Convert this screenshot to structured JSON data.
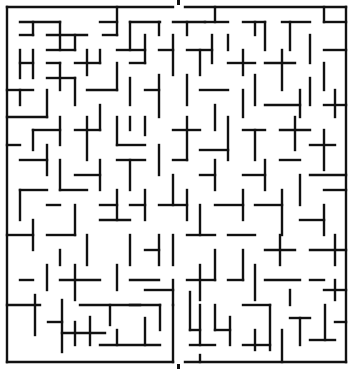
{
  "maze": {
    "title": "",
    "wall_color": "#111111",
    "background_color": "#ffffff",
    "bounds": {
      "left": 7,
      "top": 7,
      "right": 346,
      "bottom": 362
    },
    "entrance": {
      "side": "top",
      "x_from": 173,
      "x_to": 185
    },
    "exit": {
      "side": "bottom",
      "x_from": 173,
      "x_to": 185
    },
    "walls": [
      [
        7,
        7,
        173,
        7
      ],
      [
        185,
        7,
        346,
        7
      ],
      [
        7,
        7,
        7,
        362
      ],
      [
        346,
        7,
        346,
        362
      ],
      [
        7,
        362,
        173,
        362
      ],
      [
        185,
        362,
        346,
        362
      ],
      [
        20,
        22,
        60,
        22
      ],
      [
        33,
        22,
        33,
        35
      ],
      [
        20,
        35,
        33,
        35
      ],
      [
        47,
        35,
        87,
        35
      ],
      [
        60,
        22,
        60,
        50
      ],
      [
        47,
        50,
        75,
        50
      ],
      [
        75,
        35,
        75,
        50
      ],
      [
        100,
        22,
        117,
        22
      ],
      [
        117,
        7,
        117,
        35
      ],
      [
        103,
        35,
        117,
        35
      ],
      [
        130,
        22,
        160,
        22
      ],
      [
        130,
        22,
        130,
        50
      ],
      [
        145,
        35,
        145,
        63
      ],
      [
        159,
        22,
        159,
        35
      ],
      [
        173,
        22,
        205,
        22
      ],
      [
        187,
        22,
        187,
        35
      ],
      [
        215,
        7,
        215,
        22
      ],
      [
        205,
        22,
        228,
        22
      ],
      [
        228,
        35,
        228,
        50
      ],
      [
        243,
        22,
        265,
        22
      ],
      [
        255,
        22,
        255,
        35
      ],
      [
        265,
        22,
        265,
        50
      ],
      [
        282,
        22,
        310,
        22
      ],
      [
        290,
        22,
        290,
        50
      ],
      [
        324,
        22,
        346,
        22
      ],
      [
        324,
        7,
        324,
        22
      ],
      [
        20,
        50,
        20,
        78
      ],
      [
        20,
        63,
        33,
        63
      ],
      [
        33,
        50,
        33,
        78
      ],
      [
        47,
        63,
        60,
        63
      ],
      [
        60,
        63,
        60,
        90
      ],
      [
        75,
        63,
        100,
        63
      ],
      [
        87,
        50,
        87,
        75
      ],
      [
        100,
        50,
        100,
        63
      ],
      [
        117,
        50,
        145,
        50
      ],
      [
        117,
        63,
        117,
        90
      ],
      [
        130,
        63,
        145,
        63
      ],
      [
        159,
        50,
        173,
        50
      ],
      [
        173,
        35,
        173,
        75
      ],
      [
        187,
        50,
        212,
        50
      ],
      [
        200,
        50,
        200,
        75
      ],
      [
        212,
        35,
        212,
        63
      ],
      [
        228,
        63,
        255,
        63
      ],
      [
        243,
        50,
        243,
        75
      ],
      [
        265,
        63,
        295,
        63
      ],
      [
        282,
        50,
        282,
        90
      ],
      [
        310,
        35,
        310,
        63
      ],
      [
        324,
        50,
        346,
        50
      ],
      [
        324,
        63,
        324,
        90
      ],
      [
        7,
        90,
        33,
        90
      ],
      [
        20,
        90,
        20,
        105
      ],
      [
        47,
        78,
        75,
        78
      ],
      [
        47,
        90,
        47,
        117
      ],
      [
        75,
        78,
        75,
        105
      ],
      [
        87,
        90,
        117,
        90
      ],
      [
        100,
        105,
        100,
        130
      ],
      [
        130,
        78,
        130,
        105
      ],
      [
        145,
        90,
        159,
        90
      ],
      [
        159,
        75,
        159,
        117
      ],
      [
        187,
        75,
        187,
        105
      ],
      [
        200,
        90,
        228,
        90
      ],
      [
        215,
        105,
        215,
        130
      ],
      [
        243,
        90,
        243,
        117
      ],
      [
        255,
        75,
        255,
        105
      ],
      [
        265,
        105,
        300,
        105
      ],
      [
        300,
        90,
        300,
        117
      ],
      [
        310,
        78,
        310,
        105
      ],
      [
        324,
        105,
        346,
        105
      ],
      [
        335,
        90,
        335,
        117
      ],
      [
        7,
        117,
        47,
        117
      ],
      [
        33,
        130,
        33,
        150
      ],
      [
        33,
        130,
        60,
        130
      ],
      [
        60,
        117,
        60,
        145
      ],
      [
        75,
        130,
        100,
        130
      ],
      [
        87,
        117,
        87,
        160
      ],
      [
        117,
        117,
        117,
        145
      ],
      [
        117,
        145,
        145,
        145
      ],
      [
        130,
        117,
        130,
        130
      ],
      [
        145,
        117,
        145,
        135
      ],
      [
        173,
        130,
        200,
        130
      ],
      [
        187,
        117,
        187,
        160
      ],
      [
        200,
        150,
        228,
        150
      ],
      [
        228,
        117,
        228,
        160
      ],
      [
        243,
        130,
        265,
        130
      ],
      [
        255,
        130,
        255,
        160
      ],
      [
        280,
        130,
        310,
        130
      ],
      [
        295,
        117,
        295,
        150
      ],
      [
        310,
        145,
        335,
        145
      ],
      [
        324,
        130,
        324,
        170
      ],
      [
        7,
        145,
        20,
        145
      ],
      [
        20,
        160,
        47,
        160
      ],
      [
        47,
        145,
        47,
        175
      ],
      [
        60,
        160,
        60,
        190
      ],
      [
        75,
        175,
        100,
        175
      ],
      [
        100,
        160,
        100,
        190
      ],
      [
        117,
        160,
        145,
        160
      ],
      [
        130,
        160,
        130,
        190
      ],
      [
        159,
        145,
        159,
        175
      ],
      [
        173,
        160,
        187,
        160
      ],
      [
        173,
        175,
        173,
        205
      ],
      [
        200,
        175,
        215,
        175
      ],
      [
        215,
        160,
        215,
        190
      ],
      [
        243,
        175,
        265,
        175
      ],
      [
        265,
        160,
        265,
        190
      ],
      [
        280,
        160,
        300,
        160
      ],
      [
        300,
        175,
        300,
        205
      ],
      [
        310,
        175,
        346,
        175
      ],
      [
        324,
        190,
        346,
        190
      ],
      [
        20,
        190,
        20,
        220
      ],
      [
        20,
        190,
        47,
        190
      ],
      [
        47,
        205,
        60,
        205
      ],
      [
        60,
        190,
        87,
        190
      ],
      [
        75,
        205,
        75,
        235
      ],
      [
        100,
        205,
        117,
        205
      ],
      [
        117,
        190,
        117,
        220
      ],
      [
        130,
        205,
        145,
        205
      ],
      [
        145,
        190,
        145,
        220
      ],
      [
        159,
        205,
        187,
        205
      ],
      [
        187,
        190,
        187,
        220
      ],
      [
        200,
        205,
        200,
        235
      ],
      [
        215,
        205,
        243,
        205
      ],
      [
        243,
        190,
        243,
        220
      ],
      [
        255,
        205,
        282,
        205
      ],
      [
        282,
        190,
        282,
        235
      ],
      [
        300,
        220,
        324,
        220
      ],
      [
        324,
        205,
        324,
        235
      ],
      [
        7,
        235,
        33,
        235
      ],
      [
        33,
        220,
        33,
        250
      ],
      [
        47,
        235,
        75,
        235
      ],
      [
        60,
        250,
        60,
        265
      ],
      [
        87,
        235,
        87,
        265
      ],
      [
        100,
        220,
        130,
        220
      ],
      [
        130,
        235,
        130,
        265
      ],
      [
        145,
        250,
        159,
        250
      ],
      [
        159,
        235,
        159,
        265
      ],
      [
        173,
        235,
        173,
        265
      ],
      [
        187,
        235,
        215,
        235
      ],
      [
        215,
        250,
        215,
        280
      ],
      [
        228,
        235,
        255,
        235
      ],
      [
        243,
        250,
        243,
        280
      ],
      [
        265,
        250,
        295,
        250
      ],
      [
        280,
        235,
        280,
        265
      ],
      [
        310,
        250,
        346,
        250
      ],
      [
        335,
        235,
        335,
        265
      ],
      [
        20,
        280,
        33,
        280
      ],
      [
        47,
        265,
        47,
        290
      ],
      [
        60,
        280,
        100,
        280
      ],
      [
        75,
        265,
        75,
        300
      ],
      [
        117,
        265,
        117,
        290
      ],
      [
        130,
        280,
        159,
        280
      ],
      [
        145,
        290,
        173,
        290
      ],
      [
        173,
        280,
        173,
        305
      ],
      [
        187,
        280,
        215,
        280
      ],
      [
        200,
        265,
        200,
        300
      ],
      [
        228,
        280,
        243,
        280
      ],
      [
        255,
        265,
        255,
        300
      ],
      [
        265,
        280,
        300,
        280
      ],
      [
        290,
        290,
        290,
        305
      ],
      [
        310,
        280,
        324,
        280
      ],
      [
        335,
        280,
        335,
        300
      ],
      [
        324,
        290,
        346,
        290
      ],
      [
        7,
        305,
        40,
        305
      ],
      [
        35,
        295,
        35,
        335
      ],
      [
        62,
        300,
        62,
        352
      ],
      [
        48,
        322,
        62,
        322
      ],
      [
        80,
        305,
        140,
        305
      ],
      [
        110,
        305,
        110,
        325
      ],
      [
        90,
        317,
        90,
        345
      ],
      [
        62,
        333,
        105,
        333
      ],
      [
        75,
        322,
        75,
        345
      ],
      [
        100,
        345,
        160,
        345
      ],
      [
        117,
        330,
        117,
        345
      ],
      [
        130,
        305,
        160,
        305
      ],
      [
        145,
        318,
        145,
        345
      ],
      [
        160,
        305,
        160,
        330
      ],
      [
        173,
        305,
        173,
        362
      ],
      [
        190,
        292,
        190,
        330
      ],
      [
        190,
        330,
        200,
        330
      ],
      [
        200,
        305,
        200,
        345
      ],
      [
        215,
        305,
        215,
        330
      ],
      [
        215,
        330,
        230,
        330
      ],
      [
        230,
        317,
        230,
        345
      ],
      [
        243,
        305,
        270,
        305
      ],
      [
        270,
        305,
        270,
        350
      ],
      [
        255,
        330,
        255,
        350
      ],
      [
        243,
        345,
        270,
        345
      ],
      [
        290,
        318,
        310,
        318
      ],
      [
        300,
        318,
        300,
        345
      ],
      [
        282,
        330,
        282,
        362
      ],
      [
        310,
        340,
        335,
        340
      ],
      [
        325,
        305,
        325,
        340
      ],
      [
        335,
        322,
        346,
        322
      ],
      [
        190,
        345,
        215,
        345
      ],
      [
        200,
        355,
        200,
        362
      ]
    ]
  }
}
